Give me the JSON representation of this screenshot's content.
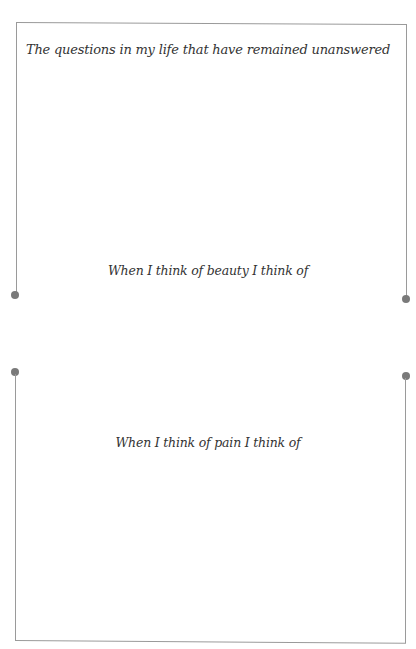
{
  "page": {
    "sections": [
      {
        "prompt": "The questions in my life that have remained unanswered"
      },
      {
        "prompt": "When I think of beauty I think of"
      },
      {
        "prompt": "When I think of pain I think of"
      }
    ]
  },
  "colors": {
    "frame_line": "#9a9a9a",
    "connector_dot": "#7a7a7a",
    "text": "#333333",
    "background": "#ffffff"
  }
}
